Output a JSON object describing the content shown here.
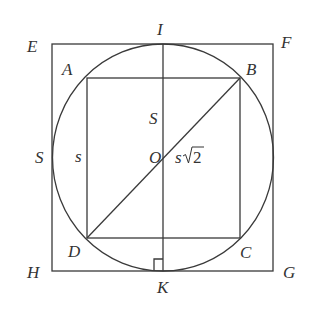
{
  "diagram": {
    "type": "geometry",
    "colors": {
      "line": "#3a3a3a",
      "text": "#333333",
      "background": "#ffffff"
    },
    "labels": {
      "E": "E",
      "F": "F",
      "G": "G",
      "H": "H",
      "A": "A",
      "B": "B",
      "C": "C",
      "D": "D",
      "I": "I",
      "K": "K",
      "O": "O",
      "S_left": "S",
      "S_inner": "S",
      "s_side": "s",
      "diag_s": "s",
      "diag_root": "2"
    },
    "shapes": {
      "outer_square": [
        "E",
        "F",
        "G",
        "H"
      ],
      "circle": {
        "center": "O"
      },
      "inner_square": [
        "A",
        "B",
        "C",
        "D"
      ],
      "segments": [
        [
          "I",
          "K"
        ],
        [
          "D",
          "B"
        ]
      ],
      "right_angle_at": "K"
    }
  }
}
